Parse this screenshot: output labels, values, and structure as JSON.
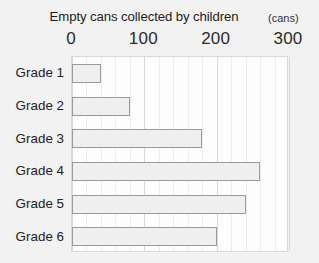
{
  "chart_data": {
    "type": "bar",
    "orientation": "horizontal",
    "title": "Empty cans collected by children",
    "unit_label": "(cans)",
    "xlabel": "",
    "ylabel": "",
    "categories": [
      "Grade 1",
      "Grade 2",
      "Grade 3",
      "Grade 4",
      "Grade 5",
      "Grade 6"
    ],
    "values": [
      40,
      80,
      180,
      260,
      240,
      200
    ],
    "xlim": [
      0,
      300
    ],
    "xticks": [
      0,
      100,
      200,
      300
    ],
    "xtick_labels": [
      "0",
      "100",
      "200",
      "300"
    ],
    "minor_tick_step": 20,
    "grid": true,
    "legend": "none",
    "bar_fill_color": "#efefef",
    "bar_edge_color": "#9a9a9a",
    "plot_background": "#fdfdfd",
    "page_background": "#f2f2f2"
  }
}
